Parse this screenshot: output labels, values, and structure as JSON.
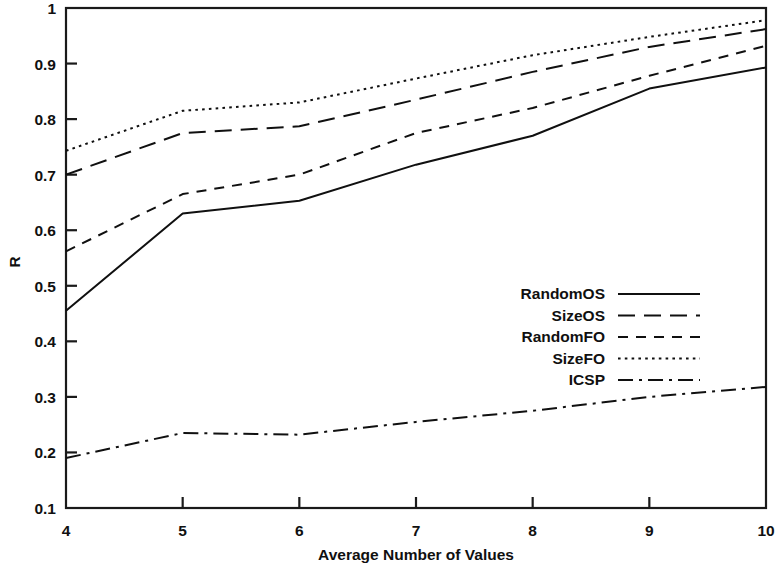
{
  "chart_data": {
    "type": "line",
    "title": "",
    "xlabel": "Average Number of Values",
    "ylabel": "R",
    "xlim": [
      4,
      10
    ],
    "ylim": [
      0.1,
      1
    ],
    "grid": false,
    "legend_position": "center-right",
    "x": [
      4,
      5,
      6,
      7,
      8,
      9,
      10
    ],
    "xticks": [
      "4",
      "5",
      "6",
      "7",
      "8",
      "9",
      "10"
    ],
    "yticks": [
      "0.1",
      "0.2",
      "0.3",
      "0.4",
      "0.5",
      "0.6",
      "0.7",
      "0.8",
      "0.9",
      "1"
    ],
    "series": [
      {
        "name": "RandomOS",
        "style": "solid",
        "values": [
          0.455,
          0.63,
          0.653,
          0.718,
          0.77,
          0.855,
          0.893
        ]
      },
      {
        "name": "SizeOS",
        "style": "long-dash",
        "values": [
          0.7,
          0.775,
          0.787,
          0.835,
          0.885,
          0.93,
          0.962
        ]
      },
      {
        "name": "RandomFO",
        "style": "dash",
        "values": [
          0.562,
          0.665,
          0.7,
          0.775,
          0.82,
          0.878,
          0.932
        ]
      },
      {
        "name": "SizeFO",
        "style": "dot",
        "values": [
          0.743,
          0.815,
          0.83,
          0.873,
          0.915,
          0.948,
          0.978
        ]
      },
      {
        "name": "ICSP",
        "style": "dash-dot",
        "values": [
          0.19,
          0.235,
          0.232,
          0.255,
          0.275,
          0.3,
          0.318
        ]
      }
    ]
  },
  "legend": {
    "entries": [
      {
        "label": "RandomOS"
      },
      {
        "label": "SizeOS"
      },
      {
        "label": "RandomFO"
      },
      {
        "label": "SizeFO"
      },
      {
        "label": "ICSP"
      }
    ]
  },
  "colors": {
    "ink": "#101010",
    "background": "#ffffff"
  }
}
